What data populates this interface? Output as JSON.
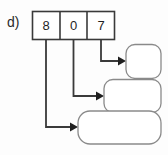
{
  "exercise": {
    "part_label": "d)"
  },
  "place_value_box": {
    "digits": [
      {
        "value": "8",
        "name": "hundreds-digit"
      },
      {
        "value": "0",
        "name": "tens-digit"
      },
      {
        "value": "7",
        "name": "ones-digit"
      }
    ]
  },
  "answer_boxes": [
    {
      "name": "answer-box-top",
      "text": ""
    },
    {
      "name": "answer-box-middle",
      "text": ""
    },
    {
      "name": "answer-box-bottom",
      "text": ""
    }
  ],
  "connectors": [
    {
      "name": "connector-ones-to-top",
      "from": "ones-digit",
      "to": "answer-box-top"
    },
    {
      "name": "connector-tens-to-middle",
      "from": "tens-digit",
      "to": "answer-box-middle"
    },
    {
      "name": "connector-hundreds-to-bottom",
      "from": "hundreds-digit",
      "to": "answer-box-bottom"
    }
  ],
  "colors": {
    "stroke": "#3a3a3a",
    "box_stroke": "#8a8a8a",
    "text": "#1f1f1f",
    "background": "#fdfdfd"
  }
}
